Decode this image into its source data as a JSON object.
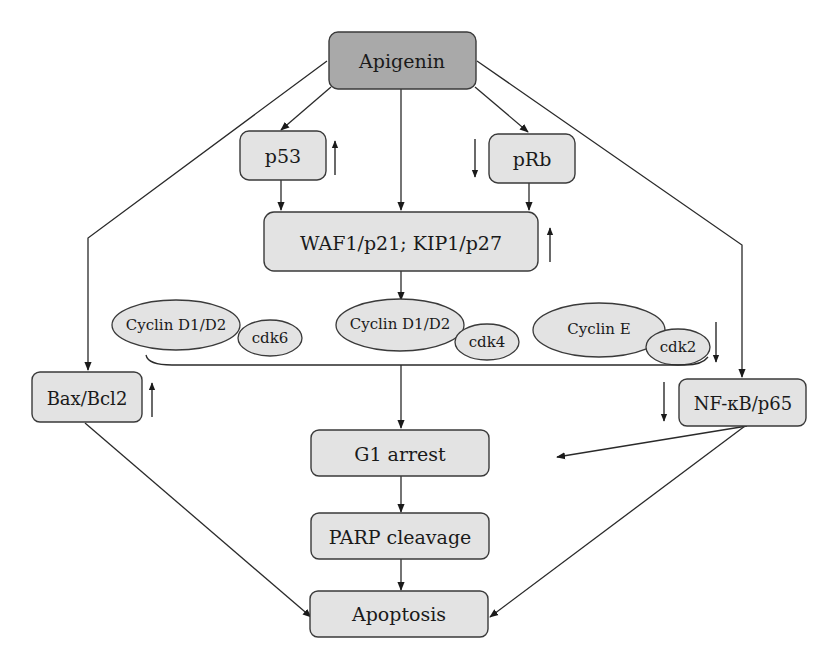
{
  "nodes": {
    "apigenin": "Apigenin",
    "p53": "p53",
    "prb": "pRb",
    "waf1": "WAF1/p21; KIP1/p27",
    "cyclin_d_a": "Cyclin D1/D2",
    "cdk6": "cdk6",
    "cyclin_d_b": "Cyclin D1/D2",
    "cdk4": "cdk4",
    "cyclin_e": "Cyclin E",
    "cdk2": "cdk2",
    "bax": "Bax/Bcl2",
    "nfkb": "NF-κB/p65",
    "g1": "G1 arrest",
    "parp": "PARP cleavage",
    "apoptosis": "Apoptosis"
  },
  "regulation": {
    "p53": "up",
    "prb": "down",
    "waf1": "up",
    "cyclin_cdk": "down",
    "bax": "up",
    "nfkb": "down"
  },
  "colors": {
    "root_fill": "#a9a9a9",
    "node_fill": "#e3e3e3",
    "stroke": "#3a3a3a"
  }
}
